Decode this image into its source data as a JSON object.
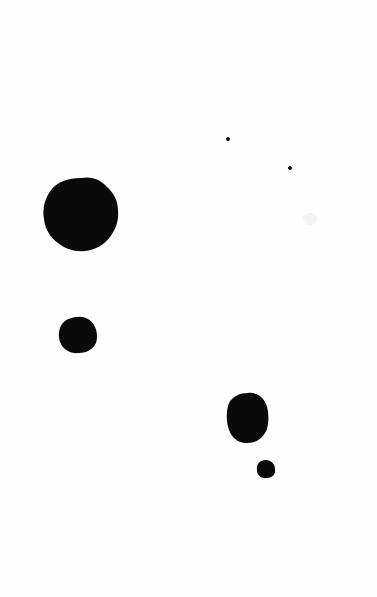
{
  "image": {
    "title": "Ink Blot Scan",
    "kind": "binary-scan",
    "width": 377,
    "height": 597,
    "background_color": "#fefefe",
    "ink_color": "#0a0a0a",
    "faint_mark_color": "#f4f4f4",
    "mark_count": 7,
    "description": "White field with seven dark ink blots of varying size scattered across the frame"
  },
  "marks": [
    {
      "id": "blot-large-upper-left",
      "label": "Large irregular blot",
      "cx": 81,
      "cy": 214,
      "rx": 37,
      "ry": 36,
      "bbox": [
        44,
        178,
        118,
        251
      ],
      "size_class": "large",
      "path": "M 81 178 C 92 176 101 180 107 187 C 114 193 118 201 118 211 C 119 220 116 229 110 237 C 104 245 95 250 85 251 C 75 252 65 249 58 243 C 50 237 45 229 44 219 C 42 209 45 198 51 190 C 57 182 68 178 81 178 Z"
    },
    {
      "id": "blot-medium-left",
      "label": "Medium blot",
      "cx": 78,
      "cy": 335,
      "rx": 19,
      "ry": 18,
      "bbox": [
        59,
        317,
        97,
        353
      ],
      "size_class": "medium",
      "path": "M 78 317 C 85 316 91 320 94 325 C 97 330 98 337 96 343 C 93 349 87 353 79 353 C 71 354 64 350 61 344 C 58 338 58 330 62 324 C 66 319 72 317 78 317 Z"
    },
    {
      "id": "blot-medium-lower-right",
      "label": "Medium oval blot",
      "cx": 248,
      "cy": 418,
      "rx": 20,
      "ry": 25,
      "bbox": [
        228,
        393,
        268,
        443
      ],
      "size_class": "medium",
      "path": "M 248 393 C 256 392 263 397 266 404 C 269 411 269 421 267 429 C 264 437 257 443 248 443 C 239 444 232 438 229 430 C 226 421 226 411 229 403 C 233 396 240 393 248 393 Z"
    },
    {
      "id": "blot-small-lower-right",
      "label": "Small blot",
      "cx": 266,
      "cy": 469,
      "rx": 9,
      "ry": 9,
      "bbox": [
        257,
        460,
        275,
        478
      ],
      "size_class": "small",
      "path": "M 266 460 C 271 460 275 464 275 469 C 276 474 272 478 267 478 C 261 479 257 475 257 470 C 256 464 260 460 266 460 Z"
    },
    {
      "id": "speck-upper-middle",
      "label": "Tiny speck",
      "cx": 228,
      "cy": 139,
      "rx": 2,
      "ry": 2,
      "bbox": [
        226,
        137,
        230,
        141
      ],
      "size_class": "speck",
      "path": "M 228 137 C 229 137 230 138 230 139 C 230 140 229 141 228 141 C 227 141 226 140 226 139 C 226 138 227 137 228 137 Z"
    },
    {
      "id": "speck-upper-right",
      "label": "Tiny speck",
      "cx": 290,
      "cy": 168,
      "rx": 2,
      "ry": 2,
      "bbox": [
        288,
        166,
        292,
        170
      ],
      "size_class": "speck",
      "path": "M 290 166 C 291 166 292 167 292 168 C 292 169 291 170 290 170 C 289 170 288 169 288 168 C 288 167 289 166 290 166 Z"
    },
    {
      "id": "smudge-faint-right",
      "label": "Faint gray smudge",
      "cx": 310,
      "cy": 219,
      "rx": 7,
      "ry": 6,
      "bbox": [
        303,
        213,
        317,
        225
      ],
      "size_class": "faint",
      "path": "M 310 213 C 314 213 317 215 317 219 C 317 222 314 225 310 225 C 306 225 303 222 303 219 C 303 215 306 213 310 213 Z"
    }
  ]
}
